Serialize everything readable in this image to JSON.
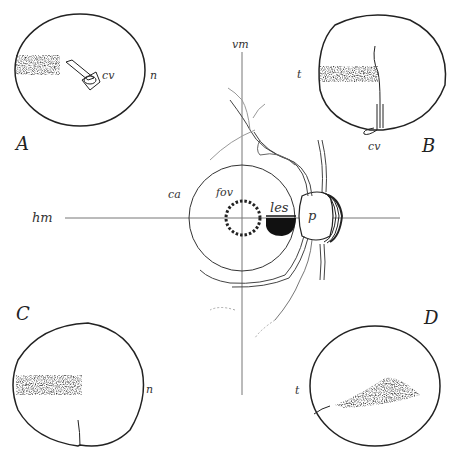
{
  "figure": {
    "axes": {
      "vertical_label": "vm",
      "horizontal_label": "hm"
    },
    "center": {
      "area_label": "ca",
      "fovea_label": "fov",
      "lesion_label": "les",
      "papilla_label": "p"
    },
    "panels": [
      {
        "id": "A",
        "label": "A",
        "side_label": "n",
        "vessel_label": "cv"
      },
      {
        "id": "B",
        "label": "B",
        "side_label": "t",
        "vessel_label": "cv"
      },
      {
        "id": "C",
        "label": "C",
        "side_label": "n"
      },
      {
        "id": "D",
        "label": "D",
        "side_label": "t"
      }
    ],
    "colors": {
      "ink": "#222222",
      "faint_ink": "#888888",
      "background": "#ffffff"
    }
  }
}
